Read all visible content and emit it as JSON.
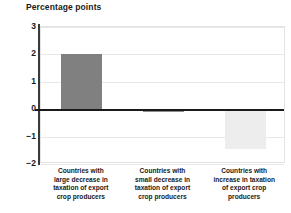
{
  "chart_data": {
    "type": "bar",
    "title": "Percentage points",
    "xlabel": "",
    "ylabel": "Percentage points",
    "ylim": [
      -2,
      3
    ],
    "yticks": [
      3,
      2,
      1,
      0,
      -1,
      -2
    ],
    "ytick_labels": [
      "3",
      "2",
      "1",
      "0",
      "−1",
      "−2"
    ],
    "grid": true,
    "legend": "none",
    "categories": [
      "Countries with large decrease in taxation of export crop producers",
      "Countries with small decrease in taxation of export crop producers",
      "Countries with increase in taxation of export crop producers"
    ],
    "values": [
      2.0,
      -0.1,
      -1.45
    ],
    "bar_colors": [
      "#808080",
      "#8c8c8c",
      "#ededed"
    ],
    "zero_line_color": "#1a1a1a",
    "gridline_color": "#e8e8e8",
    "axis_color": "#3a3a3a"
  },
  "header": {
    "axis_title": "Percentage points"
  },
  "axis": {
    "ticks": [
      {
        "label": "3",
        "value": 3
      },
      {
        "label": "2",
        "value": 2
      },
      {
        "label": "1",
        "value": 1
      },
      {
        "label": "0",
        "value": 0
      },
      {
        "label": "−1",
        "value": -1
      },
      {
        "label": "−2",
        "value": -2
      }
    ]
  },
  "categories": [
    {
      "line1": "Countries with",
      "line2": "large decrease in",
      "line3": "taxation of export",
      "line4": "crop producers"
    },
    {
      "line1": "Countries with",
      "line2": "small decrease in",
      "line3": "taxation of export",
      "line4": "crop producers"
    },
    {
      "line1": "Countries with",
      "line2": "increase in taxation",
      "line3": "of export crop",
      "line4": "producers"
    }
  ]
}
